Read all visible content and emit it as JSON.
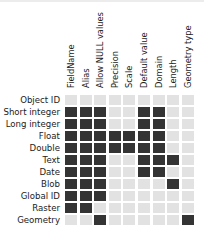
{
  "colors": {
    "on": "#343434",
    "off": "#e2e2e2",
    "text": "#222222"
  },
  "columns": [
    "FieldName",
    "Alias",
    "Allow NULL values",
    "Precision",
    "Scale",
    "Default value",
    "Domain",
    "Length",
    "Geometry type"
  ],
  "rows": [
    {
      "label": "Object ID",
      "values": [
        0,
        0,
        0,
        0,
        0,
        0,
        0,
        0,
        0
      ]
    },
    {
      "label": "Short integer",
      "values": [
        1,
        1,
        1,
        0,
        0,
        1,
        1,
        0,
        0
      ]
    },
    {
      "label": "Long integer",
      "values": [
        1,
        1,
        1,
        0,
        0,
        1,
        1,
        0,
        0
      ]
    },
    {
      "label": "Float",
      "values": [
        1,
        1,
        1,
        1,
        1,
        1,
        1,
        0,
        0
      ]
    },
    {
      "label": "Double",
      "values": [
        1,
        1,
        1,
        1,
        1,
        1,
        1,
        0,
        0
      ]
    },
    {
      "label": "Text",
      "values": [
        1,
        1,
        1,
        0,
        0,
        1,
        1,
        1,
        0
      ]
    },
    {
      "label": "Date",
      "values": [
        1,
        1,
        1,
        0,
        0,
        1,
        1,
        0,
        0
      ]
    },
    {
      "label": "Blob",
      "values": [
        1,
        1,
        1,
        0,
        0,
        0,
        0,
        1,
        0
      ]
    },
    {
      "label": "Global ID",
      "values": [
        1,
        1,
        1,
        0,
        0,
        0,
        0,
        0,
        0
      ]
    },
    {
      "label": "Raster",
      "values": [
        1,
        1,
        0,
        0,
        0,
        0,
        0,
        0,
        0
      ]
    },
    {
      "label": "Geometry",
      "values": [
        0,
        0,
        1,
        0,
        0,
        0,
        0,
        0,
        1
      ]
    }
  ]
}
